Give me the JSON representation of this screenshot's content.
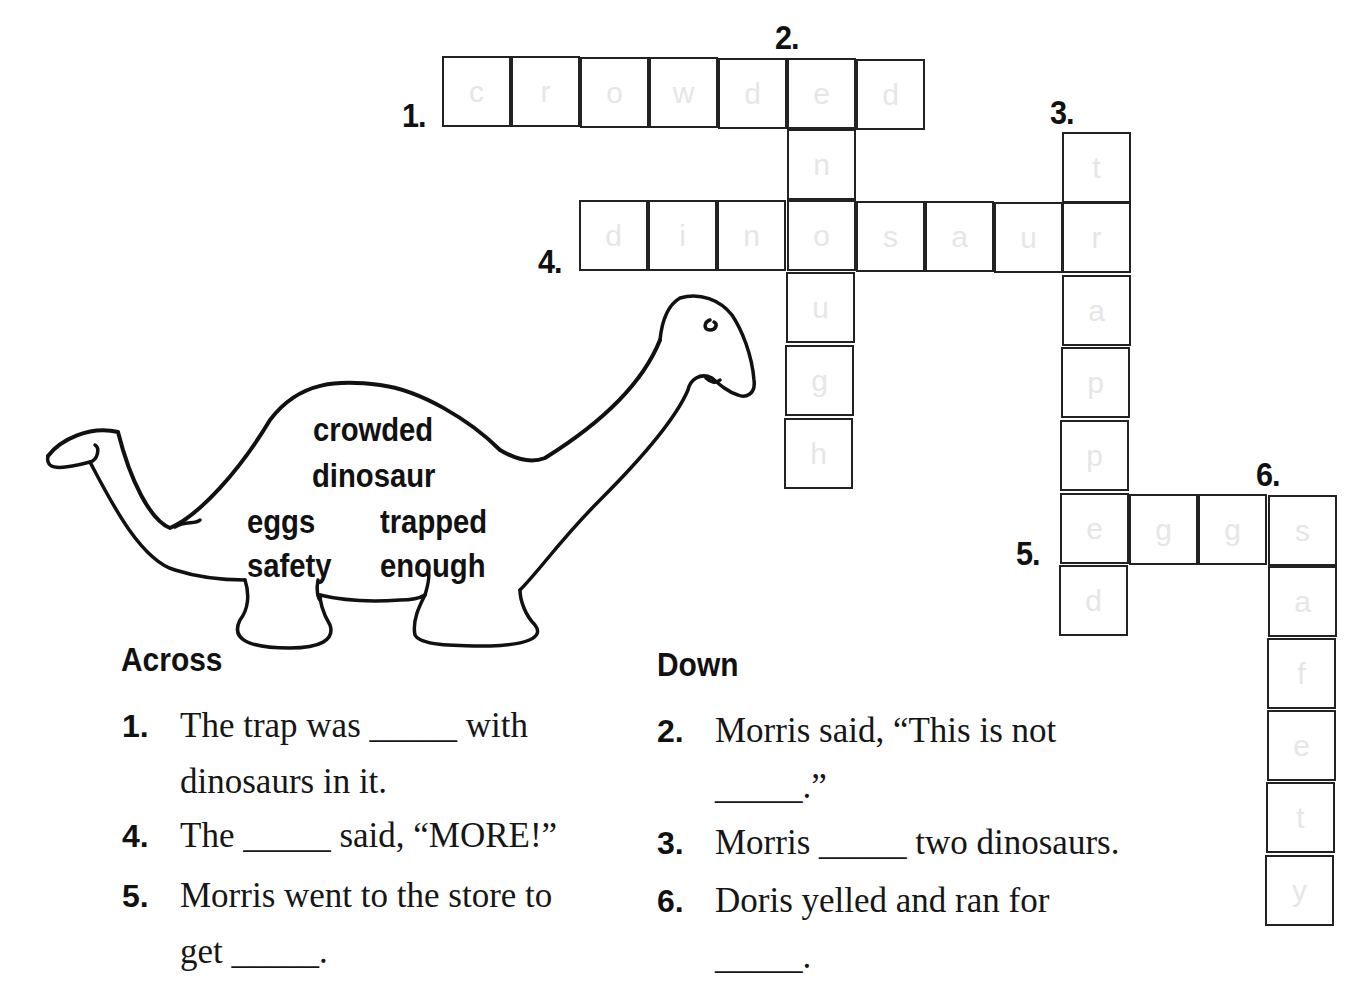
{
  "crossword": {
    "grid": {
      "cell_size": 70,
      "words": [
        {
          "number": "1.",
          "direction": "across",
          "answer": "crowded",
          "letters": [
            "c",
            "r",
            "o",
            "w",
            "d",
            "e",
            "d"
          ]
        },
        {
          "number": "2.",
          "direction": "down",
          "answer": "enough",
          "letters": [
            "e",
            "n",
            "o",
            "u",
            "g",
            "h"
          ]
        },
        {
          "number": "3.",
          "direction": "down",
          "answer": "trapped",
          "letters": [
            "t",
            "r",
            "a",
            "p",
            "p",
            "e",
            "d"
          ]
        },
        {
          "number": "4.",
          "direction": "across",
          "answer": "dinosaur",
          "letters": [
            "d",
            "i",
            "n",
            "o",
            "s",
            "a",
            "u",
            "r"
          ]
        },
        {
          "number": "5.",
          "direction": "across",
          "answer": "eggs",
          "letters": [
            "e",
            "g",
            "g",
            "s"
          ]
        },
        {
          "number": "6.",
          "direction": "down",
          "answer": "safety",
          "letters": [
            "s",
            "a",
            "f",
            "e",
            "t",
            "y"
          ]
        }
      ],
      "labels": {
        "n1": "1.",
        "n2": "2.",
        "n3": "3.",
        "n4": "4.",
        "n5": "5.",
        "n6": "6."
      }
    },
    "word_bank": {
      "words": [
        "crowded",
        "dinosaur",
        "eggs",
        "trapped",
        "safety",
        "enough"
      ]
    },
    "across": {
      "heading": "Across",
      "clues": [
        {
          "number": "1.",
          "lines": [
            "The trap was _____ with",
            "dinosaurs in it."
          ]
        },
        {
          "number": "4.",
          "lines": [
            "The _____ said, “MORE!”"
          ]
        },
        {
          "number": "5.",
          "lines": [
            "Morris went to the store to",
            "get _____."
          ]
        }
      ]
    },
    "down": {
      "heading": "Down",
      "clues": [
        {
          "number": "2.",
          "lines": [
            "Morris said, “This is not",
            "_____.”"
          ]
        },
        {
          "number": "3.",
          "lines": [
            "Morris _____ two dinosaurs."
          ]
        },
        {
          "number": "6.",
          "lines": [
            "Doris yelled and ran for",
            "_____."
          ]
        }
      ]
    },
    "colors": {
      "grid_line": "#222222",
      "faint_letter": "#e6e6e6",
      "text": "#111111",
      "background": "#ffffff"
    }
  }
}
